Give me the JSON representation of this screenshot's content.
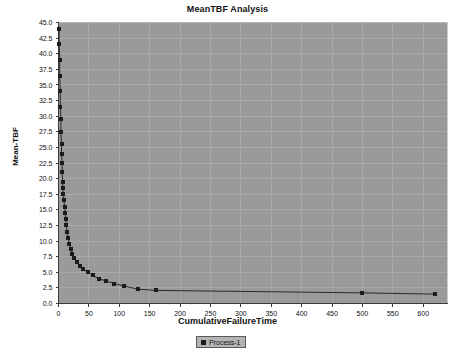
{
  "chart_data": {
    "type": "line",
    "title": "MeanTBF Analysis",
    "xlabel": "CumulativeFailureTime",
    "ylabel": "Mean-TBF",
    "grid": true,
    "legend_position": "bottom-center",
    "xlim": [
      0,
      640
    ],
    "ylim": [
      0,
      45
    ],
    "xticks": [
      0,
      50,
      100,
      150,
      200,
      250,
      300,
      350,
      400,
      450,
      500,
      550,
      600
    ],
    "yticks": [
      0.0,
      2.5,
      5.0,
      7.5,
      10.0,
      12.5,
      15.0,
      17.5,
      20.0,
      22.5,
      25.0,
      27.5,
      30.0,
      32.5,
      35.0,
      37.5,
      40.0,
      42.5,
      45.0
    ],
    "xtick_labels": [
      "0",
      "50",
      "100",
      "150",
      "200",
      "250",
      "300",
      "350",
      "400",
      "450",
      "500",
      "550",
      "600"
    ],
    "ytick_labels": [
      "0.0",
      "2.5",
      "5.0",
      "7.5",
      "10.0",
      "12.5",
      "15.0",
      "17.5",
      "20.0",
      "22.5",
      "25.0",
      "27.5",
      "30.0",
      "32.5",
      "35.0",
      "37.5",
      "40.0",
      "42.5",
      "45.0"
    ],
    "series": [
      {
        "name": "Process-1",
        "marker": "square",
        "color": "#1c1c1c",
        "x": [
          1,
          1,
          2,
          2,
          3,
          3,
          4,
          4,
          5,
          5,
          6,
          6,
          7,
          7,
          8,
          9,
          10,
          11,
          12,
          13,
          14,
          16,
          18,
          20,
          23,
          26,
          30,
          35,
          41,
          48,
          56,
          66,
          78,
          92,
          108,
          130,
          160,
          500,
          620
        ],
        "y": [
          44.0,
          41.5,
          39.0,
          36.5,
          34.0,
          31.5,
          29.5,
          27.5,
          25.5,
          24.0,
          22.5,
          21.0,
          19.5,
          18.5,
          17.5,
          16.5,
          15.5,
          14.5,
          13.5,
          12.5,
          11.5,
          10.5,
          9.5,
          8.8,
          8.0,
          7.3,
          6.7,
          6.0,
          5.5,
          5.0,
          4.5,
          4.0,
          3.6,
          3.2,
          2.8,
          2.3,
          2.1,
          1.7,
          1.5
        ]
      }
    ]
  },
  "legend": {
    "entries": [
      {
        "label": "Process-1",
        "color": "#1c1c1c"
      }
    ]
  },
  "colors": {
    "plot_background": "#9a9a9a",
    "grid": "#b0b0b0",
    "axis": "#3a3a3a",
    "series": "#1c1c1c",
    "page_background": "#ffffff"
  }
}
